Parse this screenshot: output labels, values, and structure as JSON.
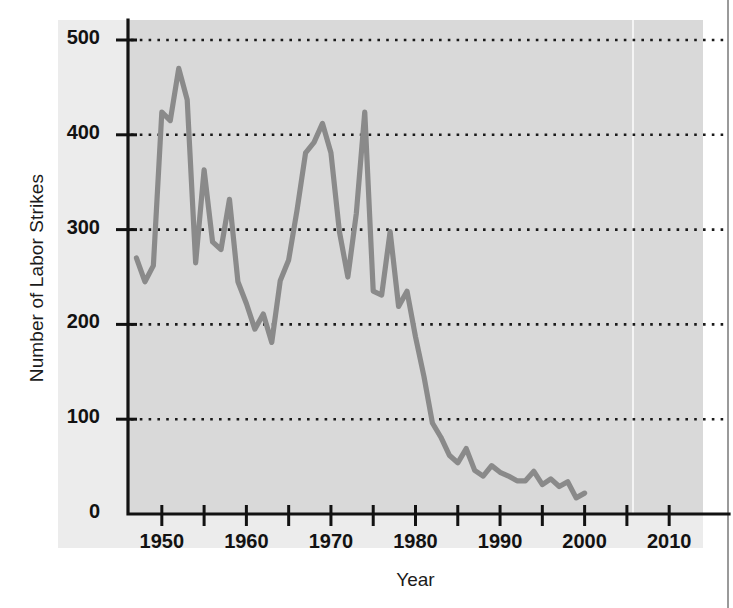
{
  "chart_data": {
    "type": "line",
    "title": "",
    "xlabel": "Year",
    "ylabel": "Number of Labor Strikes",
    "xlim": [
      1946.0,
      2014.0
    ],
    "ylim": [
      0,
      520
    ],
    "grid": "horizontal-dotted",
    "legend": "none",
    "line_color": "#8a8a8a",
    "plot_background": "#d9d9d9",
    "paper_background": "#ececec",
    "axis_color": "#121212",
    "gridline_color": "#1a1a1a",
    "y_ticks": [
      0,
      100,
      200,
      300,
      400,
      500
    ],
    "y_tick_labels": [
      "0",
      "100",
      "200",
      "300",
      "400",
      "500"
    ],
    "x_ticks": [
      1950,
      1960,
      1970,
      1980,
      1990,
      2000,
      2010
    ],
    "x_tick_labels": [
      "1950",
      "1960",
      "1970",
      "1980",
      "1990",
      "2000",
      "2010"
    ],
    "x_minor_ticks": [
      1955,
      1965,
      1975,
      1985,
      1995,
      2005
    ],
    "x": [
      1947,
      1948,
      1949,
      1950,
      1951,
      1952,
      1953,
      1954,
      1955,
      1956,
      1957,
      1958,
      1959,
      1960,
      1961,
      1962,
      1963,
      1964,
      1965,
      1966,
      1967,
      1968,
      1969,
      1970,
      1971,
      1972,
      1973,
      1974,
      1975,
      1976,
      1977,
      1978,
      1979,
      1980,
      1981,
      1982,
      1983,
      1984,
      1985,
      1986,
      1987,
      1988,
      1989,
      1990,
      1991,
      1992,
      1993,
      1994,
      1995,
      1996,
      1997,
      1998,
      1999,
      2000
    ],
    "y": [
      270,
      245,
      262,
      424,
      415,
      470,
      437,
      265,
      363,
      287,
      279,
      332,
      245,
      222,
      195,
      211,
      181,
      246,
      268,
      321,
      381,
      392,
      412,
      381,
      298,
      250,
      317,
      424,
      235,
      231,
      298,
      219,
      235,
      187,
      145,
      96,
      81,
      62,
      54,
      69,
      46,
      40,
      51,
      44,
      40,
      35,
      35,
      45,
      31,
      37,
      29,
      34,
      17,
      22
    ],
    "series_name": "Number of Labor Strikes"
  },
  "axes": {
    "ylabel_text": "Number of Labor Strikes",
    "xlabel_text": "Year"
  }
}
